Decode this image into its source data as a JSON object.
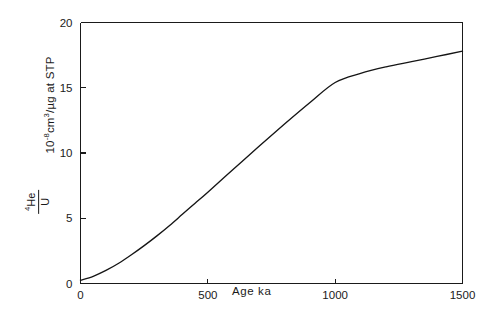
{
  "chart_data": {
    "type": "line",
    "title": "",
    "xlabel": "Age ka",
    "ylabel_units": "10⁻⁸cm³/µg at STP",
    "ylabel_numerator": "⁴He",
    "ylabel_denominator": "U",
    "xlim": [
      0,
      1500
    ],
    "ylim": [
      0,
      20
    ],
    "xticks": [
      0,
      500,
      1000,
      1500
    ],
    "xticklabels": [
      "0",
      "500",
      "1000",
      "1500"
    ],
    "yticks": [
      0,
      5,
      10,
      15,
      20
    ],
    "yticklabels": [
      "0",
      "5",
      "10",
      "15",
      "20"
    ],
    "grid": false,
    "legend": null,
    "series": [
      {
        "name": "4He/U accumulation",
        "x": [
          0,
          50,
          100,
          150,
          200,
          250,
          300,
          350,
          400,
          450,
          500,
          600,
          700,
          800,
          900,
          1000,
          1100,
          1200,
          1300,
          1400,
          1500
        ],
        "y": [
          0.25,
          0.55,
          1.0,
          1.55,
          2.2,
          2.9,
          3.65,
          4.45,
          5.3,
          6.15,
          7.0,
          8.75,
          10.5,
          12.2,
          13.85,
          15.4,
          16.1,
          16.6,
          17.0,
          17.4,
          17.8
        ]
      }
    ]
  },
  "ticks": {
    "x": [
      {
        "label": "0",
        "value": 0
      },
      {
        "label": "500",
        "value": 500
      },
      {
        "label": "1000",
        "value": 1000
      },
      {
        "label": "1500",
        "value": 1500
      }
    ],
    "y": [
      {
        "label": "0",
        "value": 0
      },
      {
        "label": "5",
        "value": 5
      },
      {
        "label": "10",
        "value": 10
      },
      {
        "label": "15",
        "value": 15
      },
      {
        "label": "20",
        "value": 20
      }
    ]
  },
  "axis": {
    "x_title": "Age ka",
    "y_units": "10",
    "y_units_exp": "-8",
    "y_units_rest": "cm",
    "y_units_exp2": "3",
    "y_units_tail": "/µg at STP",
    "y_frac_numerator_sup": "4",
    "y_frac_numerator": "He",
    "y_frac_denominator": "U"
  },
  "colors": {
    "curve": "#151515",
    "axis": "#1a1a1a",
    "background": "#ffffff"
  }
}
